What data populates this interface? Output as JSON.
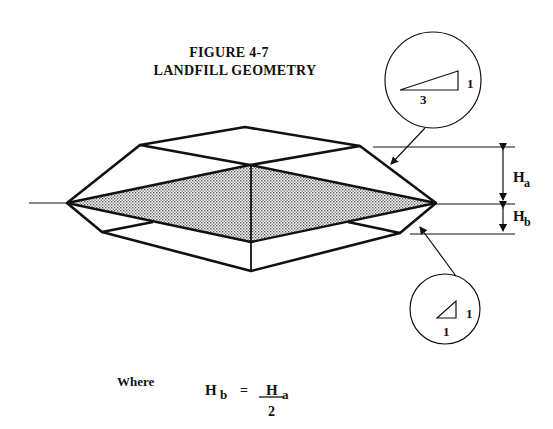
{
  "figure": {
    "number_label": "FIGURE 4-7",
    "title": "LANDFILL GEOMETRY"
  },
  "callouts": {
    "upper_slope": {
      "rise": "1",
      "run": "3",
      "description": "3:1 upper slope"
    },
    "lower_slope": {
      "rise": "1",
      "run": "1",
      "description": "1:1 lower slope"
    }
  },
  "dimensions": {
    "upper_height": {
      "symbol": "H",
      "subscript": "a"
    },
    "lower_height": {
      "symbol": "H",
      "subscript": "b"
    }
  },
  "equation": {
    "intro": "Where",
    "lhs_symbol": "H",
    "lhs_subscript": "b",
    "equals": "=",
    "numerator_symbol": "H",
    "numerator_subscript": "a",
    "denominator": "2"
  },
  "colors": {
    "line": "#111111",
    "shade": "#c8c8c8",
    "background": "#ffffff"
  }
}
